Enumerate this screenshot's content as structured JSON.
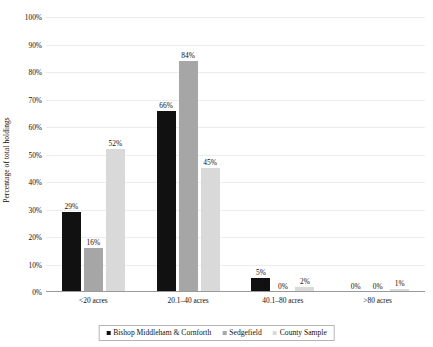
{
  "chart_data": {
    "type": "bar",
    "title": "",
    "xlabel": "",
    "ylabel": "Percentage of total holdings",
    "ylim": [
      0,
      100
    ],
    "ytick_labels": [
      "0%",
      "10%",
      "20%",
      "30%",
      "40%",
      "50%",
      "60%",
      "70%",
      "80%",
      "90%",
      "100%"
    ],
    "ytick_values": [
      0,
      10,
      20,
      30,
      40,
      50,
      60,
      70,
      80,
      90,
      100
    ],
    "grid": true,
    "legend_position": "bottom",
    "categories": [
      "<20 acres",
      "20.1–40 acres",
      "40.1–80 acres",
      ">80 acres"
    ],
    "series": [
      {
        "name": "Bishop Middleham & Cornforth",
        "color": "#111111",
        "values": [
          29,
          66,
          5,
          0
        ],
        "labels": [
          "29%",
          "66%",
          "5%",
          "0%"
        ]
      },
      {
        "name": "Sedgefield",
        "color": "#a6a6a6",
        "values": [
          16,
          84,
          0,
          0
        ],
        "labels": [
          "16%",
          "84%",
          "0%",
          "0%"
        ]
      },
      {
        "name": "County Sample",
        "color": "#d9d9d9",
        "values": [
          52,
          45,
          2,
          1
        ],
        "labels": [
          "52%",
          "45%",
          "2%",
          "1%"
        ]
      }
    ]
  }
}
